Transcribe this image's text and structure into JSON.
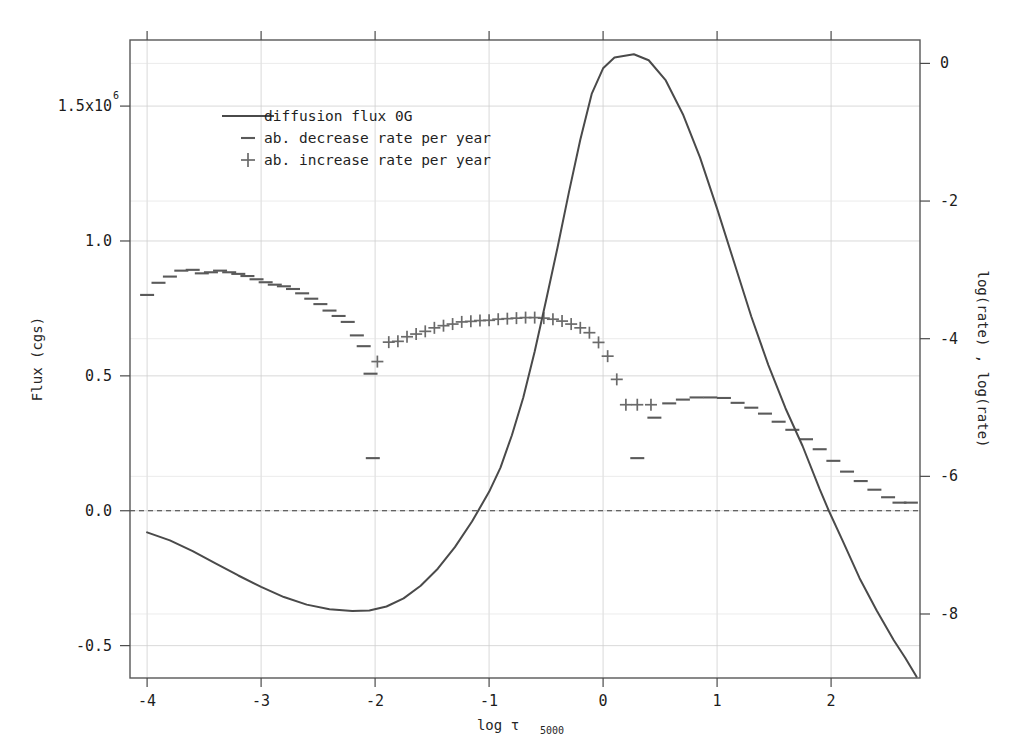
{
  "chart_data": {
    "type": "line",
    "title": "",
    "xlabel": "log t5000",
    "xlabel_main": "log τ",
    "xlabel_subscript": "5000",
    "ylabel_left": "Flux (cgs)",
    "ylabel_right": "log(rate) , log(rate)",
    "xlim": [
      -4.15,
      2.78
    ],
    "ylim_left": [
      -0.62,
      1.745
    ],
    "ylim_right": [
      -8.93,
      0.34
    ],
    "grid": true,
    "legend_position": "upper-left-inside",
    "left_axis_scale_note": "1.5x10^6",
    "left_tick_values": [
      1.5,
      1.0,
      0.5,
      0.0,
      -0.5
    ],
    "left_tick_labels": [
      "1.5x10",
      "1.0",
      "0.5",
      "0.0",
      "-0.5"
    ],
    "left_tick_exponent": "6",
    "right_tick_values": [
      0,
      -2,
      -4,
      -6,
      -8
    ],
    "right_tick_labels": [
      "0",
      "-2",
      "-4",
      "-6",
      "-8"
    ],
    "x_tick_values": [
      -4,
      -3,
      -2,
      -1,
      0,
      1,
      2
    ],
    "x_tick_labels": [
      "-4",
      "-3",
      "-2",
      "-1",
      "0",
      "1",
      "2"
    ],
    "zero_reference_line": 0.0,
    "legend": [
      {
        "label": "diffusion flux 0G",
        "marker": "line",
        "color": "#4a4a4a"
      },
      {
        "label": "ab. decrease rate per year",
        "marker": "dash",
        "color": "#5a5a5a"
      },
      {
        "label": "ab. increase rate per year",
        "marker": "plus",
        "color": "#6a6a6a"
      }
    ],
    "series": [
      {
        "name": "diffusion flux 0G",
        "marker": "line",
        "axis": "left",
        "x": [
          -4.0,
          -3.8,
          -3.6,
          -3.4,
          -3.2,
          -3.0,
          -2.8,
          -2.6,
          -2.4,
          -2.2,
          -2.05,
          -1.9,
          -1.75,
          -1.6,
          -1.45,
          -1.3,
          -1.15,
          -1.0,
          -0.9,
          -0.8,
          -0.7,
          -0.6,
          -0.5,
          -0.4,
          -0.3,
          -0.2,
          -0.1,
          0.0,
          0.1,
          0.27,
          0.4,
          0.55,
          0.7,
          0.85,
          1.0,
          1.15,
          1.3,
          1.45,
          1.6,
          1.75,
          1.9,
          1.98,
          2.1,
          2.25,
          2.4,
          2.55,
          2.65,
          2.75
        ],
        "y": [
          -0.08,
          -0.11,
          -0.15,
          -0.195,
          -0.24,
          -0.282,
          -0.32,
          -0.348,
          -0.365,
          -0.372,
          -0.37,
          -0.355,
          -0.325,
          -0.278,
          -0.215,
          -0.135,
          -0.04,
          0.07,
          0.16,
          0.28,
          0.42,
          0.59,
          0.78,
          0.975,
          1.18,
          1.375,
          1.545,
          1.64,
          1.68,
          1.692,
          1.67,
          1.595,
          1.47,
          1.31,
          1.12,
          0.92,
          0.72,
          0.54,
          0.38,
          0.24,
          0.08,
          0.0,
          -0.11,
          -0.25,
          -0.37,
          -0.48,
          -0.545,
          -0.615
        ]
      },
      {
        "name": "ab. decrease rate per year (branch 1)",
        "marker": "dash",
        "axis": "left",
        "x": [
          -4.0,
          -3.9,
          -3.8,
          -3.7,
          -3.6,
          -3.52,
          -3.44,
          -3.36,
          -3.28,
          -3.2,
          -3.12,
          -3.04,
          -2.96,
          -2.88,
          -2.8,
          -2.72,
          -2.64,
          -2.56,
          -2.48,
          -2.4,
          -2.32,
          -2.24,
          -2.16,
          -2.1
        ],
        "y": [
          0.8,
          0.845,
          0.868,
          0.89,
          0.893,
          0.88,
          0.884,
          0.89,
          0.884,
          0.878,
          0.87,
          0.858,
          0.847,
          0.838,
          0.832,
          0.822,
          0.806,
          0.786,
          0.766,
          0.742,
          0.722,
          0.7,
          0.65,
          0.61
        ]
      },
      {
        "name": "ab. decrease rate per year (branch 1 isolated)",
        "marker": "dash",
        "axis": "left",
        "x": [
          -2.02
        ],
        "y": [
          0.195
        ]
      },
      {
        "name": "ab. decrease rate per year (branch 1b)",
        "marker": "dash",
        "axis": "left",
        "x": [
          -2.04
        ],
        "y": [
          0.508
        ]
      },
      {
        "name": "ab. increase rate per year",
        "marker": "plus",
        "axis": "left",
        "x": [
          -1.98,
          -1.88,
          -1.8,
          -1.72,
          -1.64,
          -1.56,
          -1.48,
          -1.4,
          -1.32,
          -1.24,
          -1.16,
          -1.08,
          -1.0,
          -0.92,
          -0.84,
          -0.76,
          -0.68,
          -0.6,
          -0.52,
          -0.44,
          -0.36,
          -0.28,
          -0.2,
          -0.12,
          -0.04,
          0.04,
          0.12,
          0.2,
          0.3,
          0.42
        ],
        "y": [
          0.553,
          0.625,
          0.628,
          0.645,
          0.655,
          0.665,
          0.678,
          0.686,
          0.692,
          0.7,
          0.702,
          0.705,
          0.706,
          0.71,
          0.712,
          0.714,
          0.716,
          0.716,
          0.714,
          0.71,
          0.703,
          0.692,
          0.678,
          0.66,
          0.624,
          0.573,
          0.487,
          0.393,
          0.393,
          0.393
        ]
      },
      {
        "name": "ab. decrease rate per year (branch 2)",
        "marker": "dash",
        "axis": "left",
        "x": [
          0.3,
          0.45,
          0.58,
          0.7,
          0.82,
          0.94,
          1.06,
          1.18,
          1.3,
          1.42,
          1.54,
          1.66,
          1.78,
          1.9,
          2.02,
          2.14,
          2.26,
          2.38,
          2.5,
          2.6,
          2.7
        ],
        "y": [
          0.195,
          0.345,
          0.398,
          0.412,
          0.42,
          0.42,
          0.418,
          0.4,
          0.382,
          0.36,
          0.33,
          0.3,
          0.265,
          0.228,
          0.185,
          0.145,
          0.11,
          0.078,
          0.05,
          0.03,
          0.03
        ]
      }
    ]
  }
}
